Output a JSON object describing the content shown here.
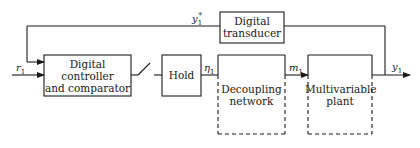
{
  "diagram": {
    "type": "block-diagram",
    "blocks": [
      {
        "id": "controller",
        "label_lines": [
          "Digital",
          "controller",
          "and comparator"
        ],
        "style": "solid"
      },
      {
        "id": "hold",
        "label_lines": [
          "Hold"
        ],
        "style": "solid"
      },
      {
        "id": "decoupling",
        "label_lines": [
          "Decoupling",
          "network"
        ],
        "style": "dashed"
      },
      {
        "id": "plant",
        "label_lines": [
          "Multivariable",
          "plant"
        ],
        "style": "dashed"
      },
      {
        "id": "transducer",
        "label_lines": [
          "Digital",
          "transducer"
        ],
        "style": "solid"
      }
    ],
    "signals": {
      "input": {
        "symbol": "r",
        "subscript": "1"
      },
      "hold_output": {
        "symbol": "η",
        "subscript": "1"
      },
      "manipulated": {
        "symbol": "m",
        "subscript": "1"
      },
      "output": {
        "symbol": "y",
        "subscript": "1"
      },
      "feedback": {
        "symbol": "y",
        "subscript": "1",
        "superscript": "*"
      }
    },
    "sampler": {
      "type": "switch"
    },
    "colors": {
      "line": "#1a1a1a",
      "background": "#ffffff"
    }
  }
}
